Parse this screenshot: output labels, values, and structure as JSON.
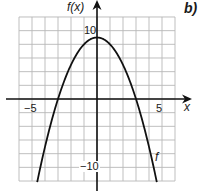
{
  "panel_label": "b)",
  "previous_panel_label_fragment": ")",
  "chart_data": {
    "type": "line",
    "title": "",
    "xlabel": "x",
    "ylabel": "f(x)",
    "xlim": [
      -6,
      6
    ],
    "ylim": [
      -12,
      12
    ],
    "grid": true,
    "grid_step": {
      "x": 1,
      "y": 2
    },
    "x_tick_labels": [
      {
        "value": -5,
        "label": "−5"
      },
      {
        "value": 5,
        "label": "5"
      }
    ],
    "y_tick_labels": [
      {
        "value": 10,
        "label": "10"
      },
      {
        "value": -10,
        "label": "−10"
      }
    ],
    "series": [
      {
        "name": "f",
        "equation": "f(x) = 9 − x²",
        "vertex": [
          0,
          9
        ],
        "x_intercepts": [
          -3,
          3
        ],
        "y_intercept": 9,
        "x": [
          -4.6,
          -4,
          -3,
          -2,
          -1,
          0,
          1,
          2,
          3,
          4,
          4.6
        ],
        "values": [
          -12.16,
          -7,
          0,
          5,
          8,
          9,
          8,
          5,
          0,
          -7,
          -12.16
        ]
      }
    ],
    "annotations": [
      {
        "text": "f",
        "x": 4.7,
        "y": -10
      }
    ],
    "legend": null
  },
  "labels": {
    "x_axis": "x",
    "y_axis": "f(x)",
    "curve": "f",
    "tick_neg5": "−5",
    "tick_pos5": "5",
    "tick_pos10": "10",
    "tick_neg10": "−10"
  },
  "colors": {
    "grid": "#b8b8b8",
    "axis": "#111111",
    "curve": "#111111",
    "background": "#ffffff"
  }
}
